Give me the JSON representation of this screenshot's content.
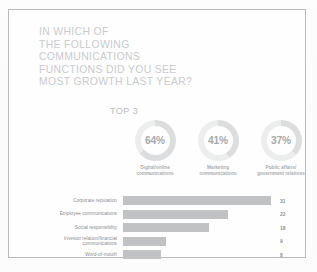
{
  "slide": {
    "title_lines": [
      "IN WHICH OF",
      "THE FOLLOWING",
      "COMMUNICATIONS",
      "FUNCTIONS DID YOU SEE",
      "MOST GROWTH LAST YEAR?"
    ],
    "top3_label": "TOP 3"
  },
  "colors": {
    "title_gray": "#c9cbcd",
    "bar_gray": "#c0c2c4",
    "ring_track": "#eceded",
    "ring_arc": "#dcdddf",
    "text_gray": "#8e9093",
    "border": "#b9babc"
  },
  "donuts": [
    {
      "percent": "64%",
      "value": 64,
      "label_lines": [
        "Digital/online",
        "communications"
      ]
    },
    {
      "percent": "41%",
      "value": 41,
      "label_lines": [
        "Marketing",
        "communications"
      ]
    },
    {
      "percent": "37%",
      "value": 37,
      "label_lines": [
        "Public affairs/",
        "government relations"
      ]
    }
  ],
  "chart_data": {
    "type": "bar",
    "orientation": "horizontal",
    "title": "TOP 3",
    "categories": [
      "Corporate reputation",
      "Employee communications",
      "Social responsibility",
      "Investor relation/financial communications",
      "Word-of-mouth"
    ],
    "values": [
      31,
      22,
      18,
      9,
      8
    ],
    "xlabel": "",
    "ylabel": "",
    "xlim": [
      0,
      31
    ],
    "grid": false,
    "legend": "none",
    "data_labels": true,
    "donut_series": {
      "type": "pie",
      "labels": [
        "Digital/online communications",
        "Marketing communications",
        "Public affairs/ government relations"
      ],
      "values": [
        64,
        41,
        37
      ],
      "units": "%"
    }
  },
  "bars": [
    {
      "label_lines": [
        "Corporate reputation"
      ],
      "value": "31",
      "pct": 100
    },
    {
      "label_lines": [
        "Employee communications"
      ],
      "value": "22",
      "pct": 71
    },
    {
      "label_lines": [
        "Social responsibility"
      ],
      "value": "18",
      "pct": 58
    },
    {
      "label_lines": [
        "Investor relation/financial",
        "communications"
      ],
      "value": "9",
      "pct": 29
    },
    {
      "label_lines": [
        "Word-of-mouth"
      ],
      "value": "8",
      "pct": 25.8
    }
  ]
}
